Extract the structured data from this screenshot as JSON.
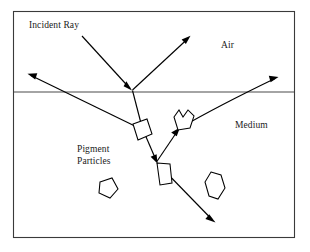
{
  "figure": {
    "width": 310,
    "height": 252,
    "background_color": "#ffffff",
    "stroke_color": "#000000",
    "border_color": "#3a3a3a"
  },
  "labels": {
    "incident_ray": "Incident Ray",
    "air": "Air",
    "medium": "Medium",
    "pigment_particles": "Pigment\nParticles"
  },
  "regions": [
    {
      "name": "air",
      "label": "Air",
      "position": "above-interface"
    },
    {
      "name": "medium",
      "label": "Medium",
      "position": "below-interface"
    }
  ],
  "interface": {
    "name": "air-medium-interface",
    "y": 92,
    "x_start": 13,
    "x_end": 295
  },
  "frame": {
    "x": 13,
    "y": 11,
    "width": 282,
    "height": 227
  },
  "rays": [
    {
      "name": "incident-ray",
      "description": "Incoming ray from upper left to surface point",
      "points": [
        [
          82,
          36
        ],
        [
          132,
          90
        ]
      ],
      "arrowhead": {
        "at": [
          132,
          90
        ],
        "angle_deg": 47
      }
    },
    {
      "name": "specular-reflected-ray",
      "description": "Ray reflected from the surface up into the air",
      "points": [
        [
          132,
          90
        ],
        [
          190,
          36
        ]
      ],
      "arrowhead": {
        "at": [
          190,
          36
        ],
        "angle_deg": -43
      }
    },
    {
      "name": "refracted-ray-to-particle-1",
      "description": "Refracted ray entering the medium toward first pigment particle",
      "points": [
        [
          132,
          90
        ],
        [
          143,
          130
        ]
      ]
    },
    {
      "name": "backscattered-ray-exiting-left",
      "description": "Ray scattered from first particle back up and out to the upper left",
      "points": [
        [
          143,
          130
        ],
        [
          28,
          74
        ]
      ],
      "arrowhead": {
        "at": [
          28,
          74
        ],
        "angle_deg": 206
      }
    },
    {
      "name": "forward-scattered-ray-to-particle-2",
      "description": "Ray from first particle down to lower pigment particle",
      "points": [
        [
          143,
          130
        ],
        [
          157,
          162
        ]
      ],
      "arrowhead": {
        "at": [
          157,
          162
        ],
        "angle_deg": 66
      }
    },
    {
      "name": "scattered-ray-down-right",
      "description": "Ray scattered downward to the lower right, absorbed deeper in medium",
      "points": [
        [
          157,
          162
        ],
        [
          215,
          222
        ]
      ],
      "arrowhead": {
        "at": [
          215,
          222
        ],
        "angle_deg": 46
      }
    },
    {
      "name": "scattered-ray-to-crown-particle",
      "description": "Ray from lower particle up-right to the crown shaped particle",
      "points": [
        [
          157,
          162
        ],
        [
          180,
          128
        ]
      ],
      "arrowhead": {
        "at": [
          180,
          128
        ],
        "angle_deg": -56
      }
    },
    {
      "name": "emergent-ray-exiting-right",
      "description": "Ray scattered from crown particle out through the surface to the upper right",
      "points": [
        [
          180,
          128
        ],
        [
          232,
          96
        ],
        [
          278,
          77
        ]
      ],
      "arrowhead": {
        "at": [
          278,
          77
        ],
        "angle_deg": -22
      }
    }
  ],
  "particles": [
    {
      "name": "pigment-particle-diamond",
      "shape": "quadrilateral",
      "points": [
        [
          133,
          124
        ],
        [
          147,
          119
        ],
        [
          152,
          134
        ],
        [
          138,
          140
        ]
      ]
    },
    {
      "name": "pigment-particle-crown",
      "shape": "crown",
      "points": [
        [
          174,
          117
        ],
        [
          179,
          110
        ],
        [
          183,
          117
        ],
        [
          188,
          110
        ],
        [
          194,
          116
        ],
        [
          190,
          128
        ],
        [
          178,
          130
        ]
      ]
    },
    {
      "name": "pigment-particle-sliver",
      "shape": "narrow-quadrilateral",
      "points": [
        [
          157,
          163
        ],
        [
          170,
          164
        ],
        [
          172,
          183
        ],
        [
          160,
          185
        ]
      ]
    },
    {
      "name": "pigment-particle-pentagon",
      "shape": "pentagon",
      "points": [
        [
          100,
          182
        ],
        [
          112,
          178
        ],
        [
          118,
          189
        ],
        [
          110,
          198
        ],
        [
          99,
          193
        ]
      ]
    },
    {
      "name": "pigment-particle-hexagon",
      "shape": "elongated-hexagon",
      "points": [
        [
          211,
          172
        ],
        [
          221,
          175
        ],
        [
          225,
          188
        ],
        [
          218,
          199
        ],
        [
          209,
          196
        ],
        [
          205,
          182
        ]
      ]
    }
  ]
}
